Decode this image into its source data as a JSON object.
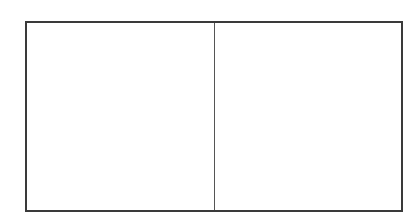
{
  "diagram": {
    "shape": "rectangle",
    "panels": [
      {
        "id": "left",
        "label": ""
      },
      {
        "id": "right",
        "label": ""
      }
    ],
    "colors": {
      "background": "#ffffff",
      "border": "#3a3a3a",
      "divider": "#555555"
    }
  }
}
